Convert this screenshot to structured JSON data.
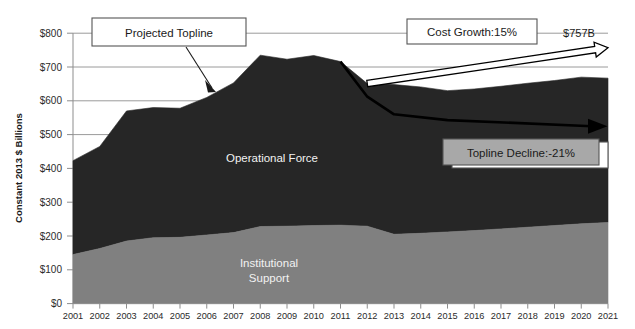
{
  "chart_data": {
    "type": "area",
    "title": "",
    "subtitle": "",
    "xlabel": "",
    "ylabel": "Constant 2013 $ Billions",
    "ylim": [
      0,
      800
    ],
    "ytick_labels": [
      "$0",
      "$100",
      "$200",
      "$300",
      "$400",
      "$500",
      "$600",
      "$700",
      "$800"
    ],
    "ytick_values": [
      0,
      100,
      200,
      300,
      400,
      500,
      600,
      700,
      800
    ],
    "grid": true,
    "stacked": true,
    "legend_position": "in-plot-labels",
    "categories": [
      2001,
      2002,
      2003,
      2004,
      2005,
      2006,
      2007,
      2008,
      2009,
      2010,
      2011,
      2012,
      2013,
      2014,
      2015,
      2016,
      2017,
      2018,
      2019,
      2020,
      2021
    ],
    "xtick_labels": [
      "2001",
      "2002",
      "2003",
      "2004",
      "2005",
      "2006",
      "2007",
      "2008",
      "2009",
      "2010",
      "2011",
      "2012",
      "2013",
      "2014",
      "2015",
      "2016",
      "2017",
      "2018",
      "2019",
      "2020",
      "2021"
    ],
    "series": [
      {
        "name": "Institutional Support",
        "color": "#808080",
        "values": [
          145,
          163,
          185,
          195,
          196,
          203,
          210,
          228,
          229,
          231,
          232,
          229,
          205,
          208,
          212,
          216,
          221,
          226,
          231,
          236,
          240
        ]
      },
      {
        "name": "Operational Force",
        "color": "#262626",
        "values": [
          278,
          302,
          385,
          385,
          382,
          407,
          443,
          507,
          494,
          503,
          484,
          422,
          443,
          433,
          418,
          419,
          422,
          426,
          429,
          434,
          427
        ]
      }
    ],
    "total_topline": [
      423,
      465,
      570,
      580,
      578,
      610,
      653,
      735,
      723,
      734,
      716,
      651,
      648,
      641,
      630,
      635,
      643,
      652,
      660,
      670,
      667
    ],
    "annotation_lines": [
      {
        "name": "cost-growth-arrow",
        "label": "Cost Growth:15%",
        "style": "white-filled-arrow",
        "start_year": 2012,
        "start_value": 651,
        "end_year": 2021,
        "end_value": 757
      },
      {
        "name": "topline-decline-arrow",
        "label": "Topline Decline:-21%",
        "style": "black-line-arrow",
        "start_year": 2011,
        "start_value": 716,
        "end_year": 2021,
        "end_value": 525
      }
    ],
    "annotations": [
      {
        "name": "projected-topline",
        "text": "Projected Topline",
        "points_to_year": 2006,
        "points_to_value": 620
      },
      {
        "name": "cost-growth",
        "text": "Cost Growth:15%",
        "points_to_year": 2014,
        "points_to_value": 680
      },
      {
        "name": "topline-decline",
        "text": "Topline Decline:-21%",
        "points_to_year": 2021,
        "points_to_value": 525
      },
      {
        "name": "endpoint-value",
        "text": "$757B",
        "points_to_year": 2021,
        "points_to_value": 757
      }
    ]
  },
  "axis": {
    "y_label": "Constant 2013 $ Billions",
    "y_ticks": [
      "$800",
      "$700",
      "$600",
      "$500",
      "$400",
      "$300",
      "$200",
      "$100",
      "$0"
    ],
    "x_ticks": [
      "2001",
      "2002",
      "2003",
      "2004",
      "2005",
      "2006",
      "2007",
      "2008",
      "2009",
      "2010",
      "2011",
      "2012",
      "2013",
      "2014",
      "2015",
      "2016",
      "2017",
      "2018",
      "2019",
      "2020",
      "2021"
    ]
  },
  "plot_labels": {
    "operational_force": "Operational Force",
    "institutional_support_line1": "Institutional",
    "institutional_support_line2": "Support"
  },
  "callouts": {
    "projected_topline": "Projected Topline",
    "cost_growth": "Cost Growth:15%",
    "topline_decline": "Topline Decline:-21%",
    "endpoint_value": "$757B"
  },
  "colors": {
    "operational_force": "#262626",
    "institutional_support": "#808080",
    "gridline": "#9a9a9a",
    "callout_fill": "#ffffff",
    "callout_gray_fill": "#a8a8a8",
    "annotation_stroke": "#000000"
  }
}
